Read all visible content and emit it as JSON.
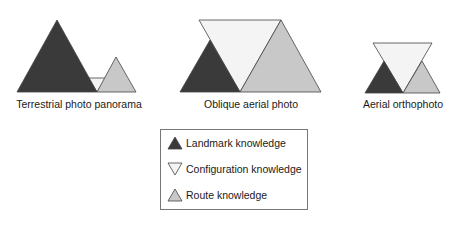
{
  "colors": {
    "landmark": "#3a3a3a",
    "configuration": "#f4f4f4",
    "route": "#c8c8c8",
    "stroke": "#444444"
  },
  "panels": [
    {
      "caption": "Terrestrial photo panorama"
    },
    {
      "caption": "Oblique aerial photo"
    },
    {
      "caption": "Aerial orthophoto"
    }
  ],
  "legend": {
    "items": [
      {
        "label": "Landmark knowledge",
        "icon": "upward-triangle-dark"
      },
      {
        "label": "Configuration knowledge",
        "icon": "downward-triangle-white"
      },
      {
        "label": "Route knowledge",
        "icon": "upward-triangle-light"
      }
    ]
  }
}
